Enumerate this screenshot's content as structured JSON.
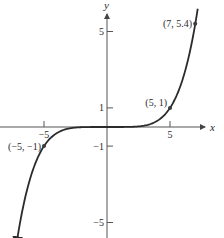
{
  "chart_data": {
    "type": "line",
    "title": "",
    "function": "y = (x/5)^5",
    "xlabel": "x",
    "ylabel": "y",
    "xlim": [
      -8.5,
      7.8
    ],
    "ylim": [
      -5.9,
      6.0
    ],
    "grid": false,
    "legend": null,
    "x_ticks": [
      {
        "value": -5,
        "label": "-5"
      },
      {
        "value": 5,
        "label": "5"
      }
    ],
    "y_ticks": [
      {
        "value": 5,
        "label": "5"
      },
      {
        "value": 1,
        "label": "1"
      },
      {
        "value": -1,
        "label": "-1"
      },
      {
        "value": -5,
        "label": "-5"
      }
    ],
    "labeled_points": [
      {
        "x": -5,
        "y": -1,
        "label": "(-5, -1)"
      },
      {
        "x": 5,
        "y": 1,
        "label": "(5, 1)"
      },
      {
        "x": 7,
        "y": 5.4,
        "label": "(7, 5.4)"
      }
    ],
    "series": [
      {
        "name": "curve",
        "x": [
          -7.2,
          -7,
          -6.5,
          -6,
          -5.5,
          -5,
          -4.5,
          -4,
          -3.5,
          -3,
          -2.5,
          -2,
          -1,
          0,
          1,
          2,
          2.5,
          3,
          3.5,
          4,
          4.5,
          5,
          5.5,
          6,
          6.5,
          7,
          7.2
        ],
        "y": [
          -6.19,
          -5.38,
          -3.71,
          -2.49,
          -1.61,
          -1.0,
          -0.59,
          -0.33,
          -0.17,
          -0.08,
          -0.03,
          -0.01,
          0.0,
          0.0,
          0.0,
          0.01,
          0.03,
          0.08,
          0.17,
          0.33,
          0.59,
          1.0,
          1.61,
          2.49,
          3.71,
          5.38,
          6.19
        ]
      }
    ],
    "colors": {
      "axis": "#555555",
      "curve": "#2b2b2b",
      "point": "#3a3a3a",
      "text": "#2a2a2a"
    }
  }
}
